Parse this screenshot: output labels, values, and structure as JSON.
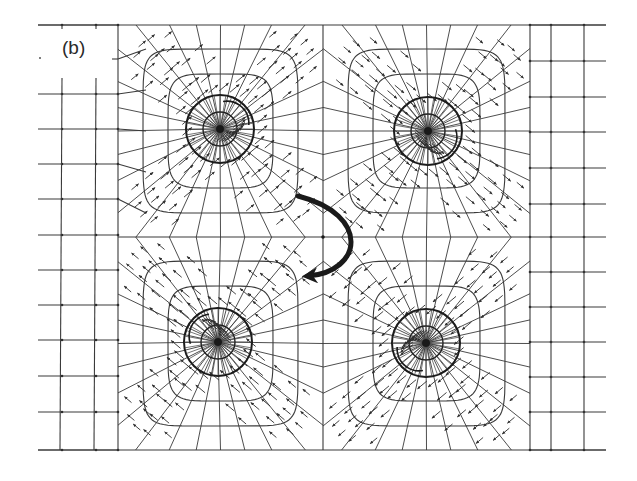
{
  "figure": {
    "panel_label": "(b)",
    "colors": {
      "line": "#3a3a3a",
      "arrow": "#2e2e2e",
      "heavy": "#1a1a1a",
      "background": "#ffffff"
    },
    "bounds": {
      "left": 38,
      "right": 606,
      "top": 25,
      "bottom": 450
    },
    "center_node": {
      "x": 323,
      "y": 237
    },
    "inner_region": {
      "left": 118,
      "right": 530,
      "top": 25,
      "bottom": 450
    },
    "left_margin_grid": {
      "verticals": [
        62,
        96
      ],
      "horizontals": [
        25,
        59,
        94,
        129,
        164,
        199,
        235,
        270,
        305,
        340,
        376,
        412,
        450
      ]
    },
    "right_margin_grid": {
      "verticals": [
        551,
        584
      ],
      "horizontals": [
        25,
        61,
        97,
        132,
        168,
        204,
        237,
        272,
        307,
        342,
        377,
        412,
        450
      ]
    },
    "vortices": [
      {
        "id": "top-left",
        "cx": 220,
        "cy": 129,
        "r_outer": 34,
        "r_inner": 17,
        "arrow_direction_deg": -40,
        "quadrant": {
          "x0": 118,
          "x1": 323,
          "y0": 25,
          "y1": 237
        }
      },
      {
        "id": "top-right",
        "cx": 428,
        "cy": 131,
        "r_outer": 34,
        "r_inner": 17,
        "arrow_direction_deg": 40,
        "quadrant": {
          "x0": 323,
          "x1": 530,
          "y0": 25,
          "y1": 237
        }
      },
      {
        "id": "bottom-left",
        "cx": 218,
        "cy": 342,
        "r_outer": 34,
        "r_inner": 17,
        "arrow_direction_deg": -140,
        "quadrant": {
          "x0": 118,
          "x1": 323,
          "y0": 237,
          "y1": 450
        }
      },
      {
        "id": "bottom-right",
        "cx": 426,
        "cy": 343,
        "r_outer": 34,
        "r_inner": 17,
        "arrow_direction_deg": 140,
        "quadrant": {
          "x0": 323,
          "x1": 530,
          "y0": 237,
          "y1": 450
        }
      }
    ],
    "curved_arrow": {
      "start": {
        "x": 298,
        "y": 196
      },
      "control1": {
        "x": 372,
        "y": 215
      },
      "control2": {
        "x": 362,
        "y": 272
      },
      "end": {
        "x": 308,
        "y": 276
      },
      "stroke_width": 5
    }
  }
}
